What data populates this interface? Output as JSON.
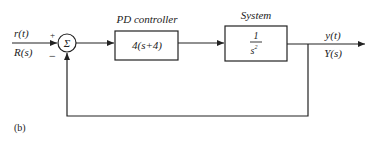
{
  "diagram": {
    "input": {
      "time_label": "r(t)",
      "laplace_label": "R(s)"
    },
    "summing_junction": {
      "symbol": "Σ",
      "plus_sign": "+",
      "minus_sign": "−"
    },
    "controller": {
      "title": "PD controller",
      "transfer_function": "4(s+4)"
    },
    "plant": {
      "title": "System",
      "numerator": "1",
      "denominator": "s",
      "exponent": "2"
    },
    "output": {
      "time_label": "y(t)",
      "laplace_label": "Y(s)"
    },
    "feedback": {
      "type": "unity negative feedback"
    },
    "caption": "(b)"
  }
}
